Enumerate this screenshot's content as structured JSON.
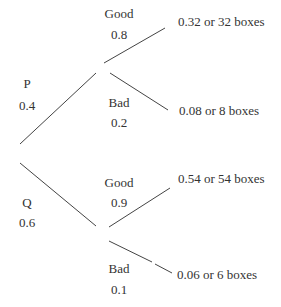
{
  "tree": {
    "level1": [
      {
        "label": "P",
        "prob": "0.4"
      },
      {
        "label": "Q",
        "prob": "0.6"
      }
    ],
    "level2": {
      "P": [
        {
          "label": "Good",
          "prob": "0.8",
          "outcome": "0.32 or 32 boxes"
        },
        {
          "label": "Bad",
          "prob": "0.2",
          "outcome": "0.08 or 8 boxes"
        }
      ],
      "Q": [
        {
          "label": "Good",
          "prob": "0.9",
          "outcome": "0.54 or 54 boxes"
        },
        {
          "label": "Bad",
          "prob": "0.1",
          "outcome": "0.06 or 6 boxes"
        }
      ]
    }
  },
  "colors": {
    "line": "#444444",
    "text": "#333333",
    "background": "#ffffff"
  }
}
